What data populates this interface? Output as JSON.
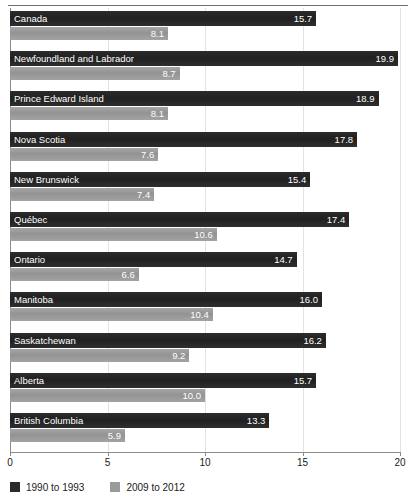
{
  "chart_data": {
    "type": "bar",
    "orientation": "horizontal",
    "title": "",
    "xlabel": "",
    "ylabel": "",
    "xlim": [
      0,
      20
    ],
    "xticks": [
      "0",
      "5",
      "10",
      "15",
      "20"
    ],
    "grid": true,
    "legend_position": "bottom-left",
    "categories": [
      "Canada",
      "Newfoundland and Labrador",
      "Prince Edward Island",
      "Nova Scotia",
      "New Brunswick",
      "Québec",
      "Ontario",
      "Manitoba",
      "Saskatchewan",
      "Alberta",
      "British Columbia"
    ],
    "series": [
      {
        "name": "1990 to 1993",
        "color": "#242424",
        "values": [
          15.7,
          19.9,
          18.9,
          17.8,
          15.4,
          17.4,
          14.7,
          16.0,
          16.2,
          15.7,
          13.3
        ],
        "labels": [
          "15.7",
          "19.9",
          "18.9",
          "17.8",
          "15.4",
          "17.4",
          "14.7",
          "16.0",
          "16.2",
          "15.7",
          "13.3"
        ]
      },
      {
        "name": "2009 to 2012",
        "color": "#9a9a9a",
        "values": [
          8.1,
          8.7,
          8.1,
          7.6,
          7.4,
          10.6,
          6.6,
          10.4,
          9.2,
          10.0,
          5.9
        ],
        "labels": [
          "8.1",
          "8.7",
          "8.1",
          "7.6",
          "7.4",
          "10.6",
          "6.6",
          "10.4",
          "9.2",
          "10.0",
          "5.9"
        ]
      }
    ]
  },
  "legend": {
    "items": [
      {
        "label": "1990 to 1993",
        "color": "#2b2b2b"
      },
      {
        "label": "2009 to 2012",
        "color": "#9a9a9a"
      }
    ]
  }
}
